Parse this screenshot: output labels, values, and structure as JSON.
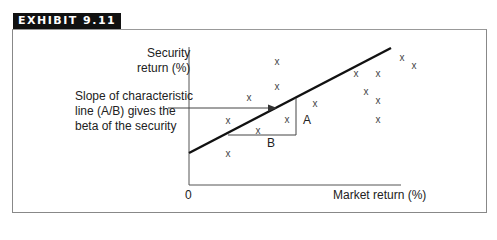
{
  "exhibit": {
    "label": "EXHIBIT 9.11"
  },
  "diagram": {
    "y_axis_label_line1": "Security",
    "y_axis_label_line2": "return (%)",
    "x_axis_label": "Market return (%)",
    "origin_label": "0",
    "annotation_line1": "Slope of characteristic",
    "annotation_line2": "line (A/B) gives the",
    "annotation_line3": "beta of the security",
    "rise_label": "A",
    "run_label": "B",
    "point_marker": "x",
    "points": [
      [
        277,
        61
      ],
      [
        249,
        97
      ],
      [
        277,
        86
      ],
      [
        356,
        73
      ],
      [
        378,
        73
      ],
      [
        402,
        57
      ],
      [
        366,
        91
      ],
      [
        414,
        65
      ],
      [
        378,
        100
      ],
      [
        315,
        103
      ],
      [
        228,
        120
      ],
      [
        258,
        130
      ],
      [
        287,
        119
      ],
      [
        378,
        119
      ],
      [
        228,
        153
      ]
    ],
    "line_color": "#111111"
  }
}
